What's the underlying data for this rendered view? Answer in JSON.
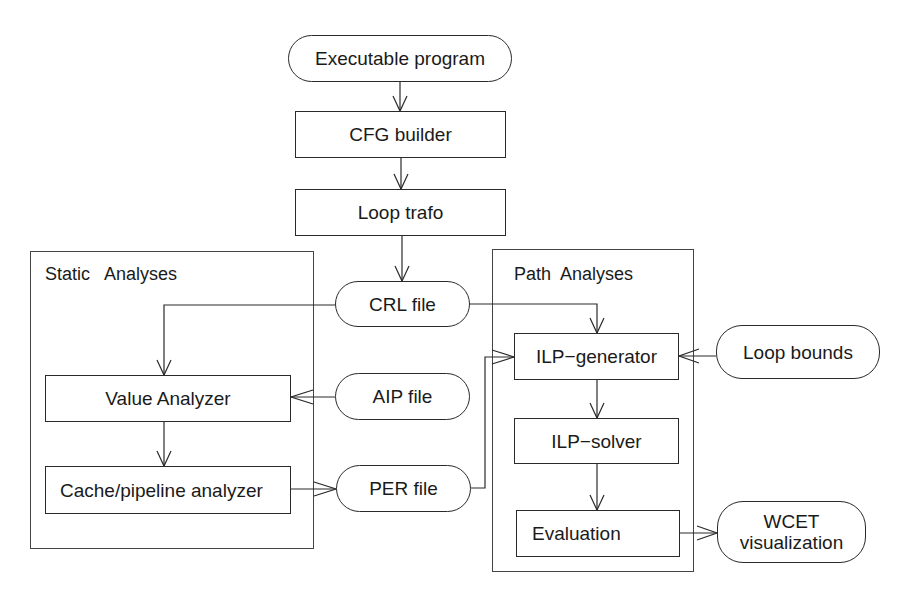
{
  "diagram": {
    "type": "flowchart",
    "nodes": {
      "executable_program": {
        "label": "Executable program",
        "shape": "rounded"
      },
      "cfg_builder": {
        "label": "CFG builder",
        "shape": "rect"
      },
      "loop_trafo": {
        "label": "Loop trafo",
        "shape": "rect"
      },
      "crl_file": {
        "label": "CRL file",
        "shape": "rounded"
      },
      "aip_file": {
        "label": "AIP file",
        "shape": "rounded"
      },
      "per_file": {
        "label": "PER file",
        "shape": "rounded"
      },
      "value_analyzer": {
        "label": "Value Analyzer",
        "shape": "rect"
      },
      "cache_pipeline_analyzer": {
        "label": "Cache/pipeline analyzer",
        "shape": "rect"
      },
      "ilp_generator": {
        "label": "ILP−generator",
        "shape": "rect"
      },
      "ilp_solver": {
        "label": "ILP−solver",
        "shape": "rect"
      },
      "evaluation": {
        "label": "Evaluation",
        "shape": "rect"
      },
      "loop_bounds": {
        "label": "Loop bounds",
        "shape": "rounded"
      },
      "wcet_visualization": {
        "label": "WCET visualization",
        "line1": "WCET",
        "line2": "visualization",
        "shape": "rounded"
      }
    },
    "groups": {
      "static_analyses": {
        "label": "Static   Analyses"
      },
      "path_analyses": {
        "label": "Path  Analyses"
      }
    },
    "edges": [
      {
        "from": "Executable program",
        "to": "CFG builder"
      },
      {
        "from": "CFG builder",
        "to": "Loop trafo"
      },
      {
        "from": "Loop trafo",
        "to": "CRL file"
      },
      {
        "from": "CRL file",
        "to": "Value Analyzer"
      },
      {
        "from": "CRL file",
        "to": "ILP-generator"
      },
      {
        "from": "AIP file",
        "to": "Value Analyzer"
      },
      {
        "from": "Value Analyzer",
        "to": "Cache/pipeline analyzer"
      },
      {
        "from": "Cache/pipeline analyzer",
        "to": "PER file"
      },
      {
        "from": "PER file",
        "to": "ILP-generator"
      },
      {
        "from": "Loop bounds",
        "to": "ILP-generator"
      },
      {
        "from": "ILP-generator",
        "to": "ILP-solver"
      },
      {
        "from": "ILP-solver",
        "to": "Evaluation"
      },
      {
        "from": "Evaluation",
        "to": "WCET visualization"
      }
    ]
  }
}
